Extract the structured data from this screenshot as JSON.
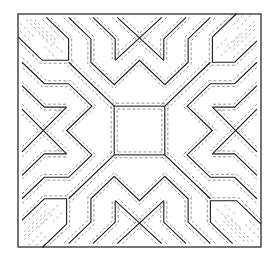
{
  "figure": {
    "title": "Symmetric geometric line pattern",
    "colors": {
      "line": "#1a1a1a",
      "dashed_line": "#6a6a6a",
      "background": "#ffffff"
    },
    "frame": {
      "x": 18,
      "y": 14,
      "width": 243,
      "height": 233
    },
    "center_square": {
      "x": 115,
      "y": 105,
      "width": 50,
      "height": 50
    },
    "symmetry": "4-fold rotational",
    "hatched_corners": [
      "top-left",
      "top-right",
      "bottom-left",
      "bottom-right"
    ]
  }
}
